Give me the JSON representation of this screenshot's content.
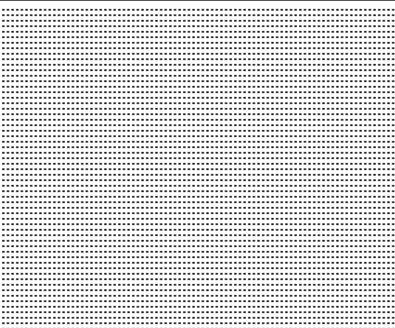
{
  "canvas": {
    "type": "dot-grid",
    "width": 395,
    "height": 328,
    "background_color": "#ffffff",
    "dot_color": "#111111",
    "top_border_color": "#555555",
    "dot_pitch_x": 4.65,
    "dot_pitch_y": 5.5
  }
}
